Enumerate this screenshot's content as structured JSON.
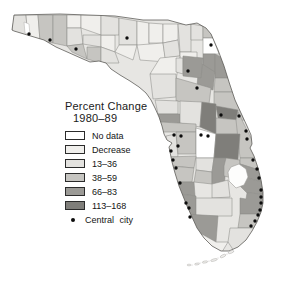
{
  "title": {
    "line1": "Percent Change",
    "line2": "1980–89"
  },
  "legend": {
    "items": [
      {
        "label": "No data",
        "color": "#ffffff"
      },
      {
        "label": "Decrease",
        "color": "#f0efec"
      },
      {
        "label": "13–36",
        "color": "#e3e2df"
      },
      {
        "label": "38–59",
        "color": "#c6c5c1"
      },
      {
        "label": "66–83",
        "color": "#9b9a96"
      },
      {
        "label": "113–168",
        "color": "#7f7e7a"
      }
    ],
    "marker": {
      "label": "Central city",
      "symbol": "black-dot",
      "color": "#0c0c0c"
    }
  },
  "map": {
    "region": "Florida counties",
    "base_color": "#e7e6e3",
    "county_border_color": "#8e8d8a",
    "outline_color": "#5f5e5b",
    "outline": "14,15 60,14 115,16 143,20 168,20 186,25 197,23 206,28 211,34 218,50 224,66 229,82 235,100 241,113 247,126 251,135 252,144 250,148 254,156 258,168 261,180 263,192 263,203 261,212 257,222 252,231 246,240 238,247 229,251 221,251 212,246 204,238 197,228 192,217 187,206 183,196 179,186 175,173 172,162 170,152 169,147 172,143 167,140 164,134 162,126 159,117 155,108 151,100 146,93 139,87 130,81 120,75 111,69 106,63 99,61 90,62 83,59 74,55 65,51 56,47 44,40 34,37 24,34 14,31 12,30",
    "counties": [
      {
        "name": "escambia",
        "category": "13–36",
        "points": "13,15 26,15 28,39 19,35 12,31"
      },
      {
        "name": "santa-rosa",
        "category": "Decrease",
        "points": "26,15 38,15 40,41 28,39"
      },
      {
        "name": "okaloosa",
        "category": "38–59",
        "points": "38,15 53,15 53,43 40,41"
      },
      {
        "name": "walton",
        "category": "38–59",
        "points": "53,15 67,15 67,46 53,43"
      },
      {
        "name": "holmes",
        "category": "Decrease",
        "points": "67,15 81,15 81,28 67,28"
      },
      {
        "name": "washington",
        "category": "13–36",
        "points": "67,28 81,28 83,44 67,46"
      },
      {
        "name": "bay",
        "category": "38–59",
        "points": "67,46 83,44 87,59 72,52"
      },
      {
        "name": "jackson",
        "category": "Decrease",
        "points": "81,15 101,15 101,35 81,28"
      },
      {
        "name": "calhoun",
        "category": "13–36",
        "points": "83,35 101,35 101,47 83,44"
      },
      {
        "name": "gulf",
        "category": "38–59",
        "points": "87,47 101,47 101,63 87,59"
      },
      {
        "name": "liberty",
        "category": "Decrease",
        "points": "101,35 115,35 115,52 101,47"
      },
      {
        "name": "franklin",
        "category": "13–36",
        "points": "101,47 115,52 119,63 101,63"
      },
      {
        "name": "gadsden",
        "category": "13–36",
        "points": "101,15 119,18 119,35 101,35"
      },
      {
        "name": "leon",
        "category": "13–36",
        "points": "119,18 137,21 137,45 119,45"
      },
      {
        "name": "wakulla",
        "category": "Decrease",
        "points": "119,45 137,45 133,60 115,52"
      },
      {
        "name": "jefferson",
        "category": "Decrease",
        "points": "137,21 149,23 149,50 137,45"
      },
      {
        "name": "madison",
        "category": "Decrease",
        "points": "149,23 163,24 163,43 149,43"
      },
      {
        "name": "taylor",
        "category": "Decrease",
        "points": "137,45 163,43 166,62 140,60"
      },
      {
        "name": "hamilton",
        "category": "Decrease",
        "points": "163,24 178,24 178,40 163,43"
      },
      {
        "name": "suwannee",
        "category": "13–36",
        "points": "163,43 178,40 180,56 165,58"
      },
      {
        "name": "columbia",
        "category": "13–36",
        "points": "178,24 191,24 191,52 180,52"
      },
      {
        "name": "baker",
        "category": "13–36",
        "points": "191,24 203,26 203,40 191,40"
      },
      {
        "name": "nassau",
        "category": "38–59",
        "points": "196,21 208,26 213,38 203,38 203,27"
      },
      {
        "name": "duval",
        "category": "No data",
        "points": "203,38 213,38 219,54 203,54"
      },
      {
        "name": "bradford",
        "category": "Decrease",
        "points": "180,52 197,52 197,62 180,60"
      },
      {
        "name": "clay",
        "category": "66–83",
        "points": "203,54 215,54 215,74 203,74"
      },
      {
        "name": "st-johns",
        "category": "66–83",
        "points": "215,54 221,57 228,78 215,78"
      },
      {
        "name": "dixie",
        "category": "Decrease",
        "points": "160,58 180,56 176,80 150,74"
      },
      {
        "name": "gilchrist",
        "category": "13–36",
        "points": "176,58 183,58 183,74 176,72"
      },
      {
        "name": "putnam",
        "category": "66–83",
        "points": "199,62 215,72 213,90 197,86"
      },
      {
        "name": "alachua",
        "category": "66–83",
        "points": "183,56 203,58 201,78 183,76"
      },
      {
        "name": "flagler",
        "category": "38–59",
        "points": "215,78 228,78 234,92 214,92"
      },
      {
        "name": "levy",
        "category": "13–36",
        "points": "150,74 176,74 176,97 153,99"
      },
      {
        "name": "marion",
        "category": "38–59",
        "points": "176,78 211,88 209,104 176,101"
      },
      {
        "name": "volusia",
        "category": "38–59",
        "points": "214,92 234,92 244,120 228,124 214,106"
      },
      {
        "name": "citrus",
        "category": "13–36",
        "points": "155,100 178,101 178,114 158,114"
      },
      {
        "name": "hernando",
        "category": "66–83",
        "points": "158,114 180,114 180,123 160,122"
      },
      {
        "name": "sumter",
        "category": "13–36",
        "points": "180,101 202,102 200,127 180,123"
      },
      {
        "name": "lake",
        "category": "113–168",
        "points": "202,102 216,104 216,134 200,127"
      },
      {
        "name": "seminole",
        "category": "113–168",
        "points": "216,106 238,110 236,120 218,118"
      },
      {
        "name": "orange",
        "category": "38–59",
        "points": "216,118 240,120 240,134 216,134"
      },
      {
        "name": "brevard",
        "category": "38–59",
        "points": "238,112 252,140 257,158 240,158 236,120"
      },
      {
        "name": "pasco",
        "category": "38–59",
        "points": "160,122 196,124 196,132 162,132"
      },
      {
        "name": "pinellas",
        "category": "13–36",
        "points": "166,136 176,134 178,157 168,157"
      },
      {
        "name": "hillsborough",
        "category": "38–59",
        "points": "176,132 196,132 196,154 178,154"
      },
      {
        "name": "polk",
        "category": "No data",
        "points": "196,128 216,134 214,158 196,158"
      },
      {
        "name": "osceola",
        "category": "113–168",
        "points": "216,134 240,134 238,160 214,158"
      },
      {
        "name": "manatee",
        "category": "38–59",
        "points": "168,157 196,156 194,168 171,166"
      },
      {
        "name": "hardee",
        "category": "13–36",
        "points": "196,158 214,158 212,172 196,170"
      },
      {
        "name": "sarasota",
        "category": "38–59",
        "points": "171,166 194,168 192,182 175,182"
      },
      {
        "name": "desoto",
        "category": "38–59",
        "points": "196,170 212,172 212,184 194,182"
      },
      {
        "name": "highlands",
        "category": "66–83",
        "points": "214,158 226,158 224,196 212,184 212,172"
      },
      {
        "name": "okeechobee",
        "category": "38–59",
        "points": "226,158 240,160 240,180 224,176 224,166"
      },
      {
        "name": "indian-river",
        "category": "38–59",
        "points": "240,158 257,158 259,170 240,164"
      },
      {
        "name": "st-lucie",
        "category": "66–83",
        "points": "240,164 259,170 262,182 240,176"
      },
      {
        "name": "martin",
        "category": "66–83",
        "points": "240,176 262,182 263,194 247,193 240,186"
      },
      {
        "name": "charlotte",
        "category": "66–83",
        "points": "175,182 194,182 195,196 180,194"
      },
      {
        "name": "glades",
        "category": "13–36",
        "points": "212,184 228,180 230,197 212,198"
      },
      {
        "name": "lee",
        "category": "66–83",
        "points": "180,194 196,196 196,216 186,214"
      },
      {
        "name": "hendry",
        "category": "13–36",
        "points": "196,198 232,198 232,216 196,216"
      },
      {
        "name": "palm-beach",
        "category": "66–83",
        "points": "247,193 263,194 262,214 240,214 240,198 246,199"
      },
      {
        "name": "collier",
        "category": "66–83",
        "points": "186,214 218,216 216,242 198,232 190,222"
      },
      {
        "name": "broward",
        "category": "38–59",
        "points": "240,214 262,214 259,228 238,228"
      },
      {
        "name": "miami-dade",
        "category": "13–36",
        "points": "238,228 259,228 252,238 244,248 234,251 228,242 230,228"
      },
      {
        "name": "monroe",
        "category": "Decrease",
        "points": "198,232 216,242 228,242 222,252 208,246 199,238"
      }
    ],
    "water": [
      {
        "name": "pensacola-bay",
        "points": "24,22 29,24 30,35 25,33"
      }
    ],
    "lake": {
      "name": "lake-okeechobee",
      "points": "231,167 239,164 246,169 248,177 244,185 236,188 229,181 228,172"
    },
    "keys": [
      {
        "cx": 231,
        "cy": 252,
        "rx": 3.0,
        "ry": 1.2,
        "rot": -20
      },
      {
        "cx": 223,
        "cy": 256,
        "rx": 3.0,
        "ry": 1.2,
        "rot": -25
      },
      {
        "cx": 214,
        "cy": 260,
        "rx": 3.4,
        "ry": 1.1,
        "rot": -15
      },
      {
        "cx": 205,
        "cy": 262,
        "rx": 2.8,
        "ry": 1.0,
        "rot": -10
      },
      {
        "cx": 197,
        "cy": 264,
        "rx": 2.4,
        "ry": 0.9,
        "rot": -8
      },
      {
        "cx": 189,
        "cy": 265,
        "rx": 2.0,
        "ry": 0.8,
        "rot": 0
      }
    ],
    "key_specks": [
      [
        227,
        254
      ],
      [
        218,
        258
      ],
      [
        209,
        261
      ],
      [
        200,
        263
      ],
      [
        192,
        265
      ]
    ],
    "central_cities": [
      [
        29,
        34
      ],
      [
        50,
        40
      ],
      [
        76,
        49
      ],
      [
        127,
        38
      ],
      [
        211,
        45
      ],
      [
        188,
        71
      ],
      [
        197,
        88
      ],
      [
        221,
        115
      ],
      [
        239,
        116
      ],
      [
        246,
        131
      ],
      [
        247,
        139
      ],
      [
        201,
        135
      ],
      [
        208,
        136
      ],
      [
        174,
        135
      ],
      [
        181,
        136
      ],
      [
        178,
        146
      ],
      [
        171,
        151
      ],
      [
        173,
        160
      ],
      [
        176,
        168
      ],
      [
        180,
        183
      ],
      [
        186,
        203
      ],
      [
        189,
        208
      ],
      [
        190,
        217
      ],
      [
        253,
        160
      ],
      [
        257,
        169
      ],
      [
        259,
        178
      ],
      [
        261,
        190
      ],
      [
        261,
        197
      ],
      [
        261,
        203
      ],
      [
        260,
        210
      ],
      [
        258,
        215
      ],
      [
        255,
        221
      ],
      [
        251,
        226
      ]
    ]
  }
}
